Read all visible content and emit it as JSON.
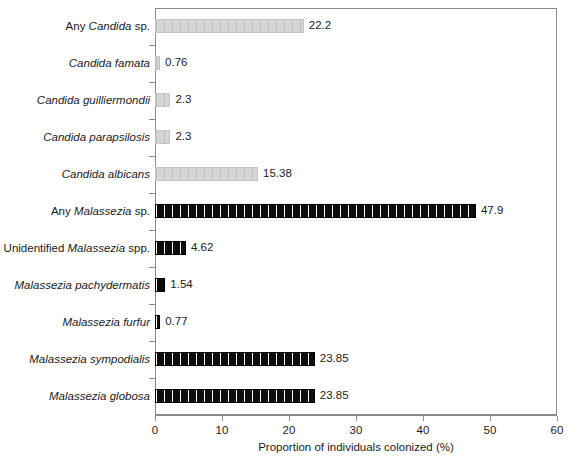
{
  "chart_data": {
    "type": "bar",
    "orientation": "horizontal",
    "title": "",
    "xlabel": "Proportion of individuals colonized (%)",
    "ylabel": "",
    "xlim": [
      0,
      60
    ],
    "xticks": [
      0,
      10,
      20,
      30,
      40,
      50,
      60
    ],
    "xticklabels": [
      "0",
      "10",
      "20",
      "30",
      "40",
      "50",
      "60"
    ],
    "grid": false,
    "legend": null,
    "categories": [
      "Any Candida sp.",
      "Candida famata",
      "Candida guilliermondii",
      "Candida parapsilosis",
      "Candida albicans",
      "Any Malassezia sp.",
      "Unidentified Malassezia spp.",
      "Malassezia pachydermatis",
      "Malassezia furfur",
      "Malassezia sympodialis",
      "Malassezia globosa"
    ],
    "values": [
      22.2,
      0.76,
      2.3,
      2.3,
      15.38,
      47.9,
      4.62,
      1.54,
      0.77,
      23.85,
      23.85
    ],
    "value_labels": [
      "22.2",
      "0.76",
      "2.3",
      "2.3",
      "15.38",
      "47.9",
      "4.62",
      "1.54",
      "0.77",
      "23.85",
      "23.85"
    ],
    "bar_styles": [
      "light",
      "light",
      "light",
      "light",
      "light",
      "dark",
      "dark",
      "dark",
      "dark",
      "dark",
      "dark"
    ],
    "colors": {
      "light_fill": "#d2d2d2",
      "light_hatch": "#bdbdbd",
      "dark_fill": "#111111",
      "dark_hatch": "#ffffff",
      "axis": "#8a8a8a",
      "text": "#1a1a1a",
      "background": "#ffffff"
    }
  },
  "axis": {
    "x_title": "Proportion of individuals colonized (%)"
  },
  "labels": [
    {
      "prefix": "Any ",
      "italic": "Candida",
      "suffix": " sp."
    },
    {
      "prefix": "",
      "italic": "Candida famata",
      "suffix": ""
    },
    {
      "prefix": "",
      "italic": "Candida guilliermondii",
      "suffix": ""
    },
    {
      "prefix": "",
      "italic": "Candida parapsilosis",
      "suffix": ""
    },
    {
      "prefix": "",
      "italic": "Candida albicans",
      "suffix": ""
    },
    {
      "prefix": "Any ",
      "italic": "Malassezia",
      "suffix": " sp."
    },
    {
      "prefix": "Unidentified ",
      "italic": "Malassezia",
      "suffix": " spp."
    },
    {
      "prefix": "",
      "italic": "Malassezia pachydermatis",
      "suffix": ""
    },
    {
      "prefix": "",
      "italic": "Malassezia furfur",
      "suffix": ""
    },
    {
      "prefix": "",
      "italic": "Malassezia sympodialis",
      "suffix": ""
    },
    {
      "prefix": "",
      "italic": "Malassezia globosa",
      "suffix": ""
    }
  ]
}
